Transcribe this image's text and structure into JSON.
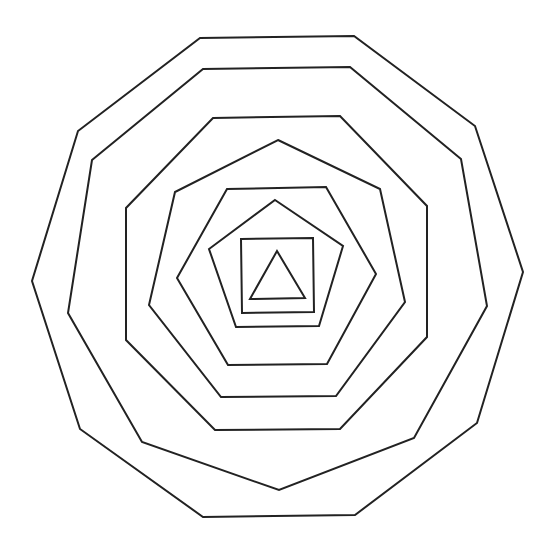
{
  "diagram": {
    "background": "#ffffff",
    "stroke_color": "#222222",
    "stroke_width": 2,
    "shapes": [
      {
        "name": "decagon",
        "sides": 10,
        "points": "200,38 354,36 475,126 523,272 477,423 355,515 203,517 80,429 32,281 78,131"
      },
      {
        "name": "nonagon",
        "sides": 9,
        "points": "203,69 350,67 461,159 487,306 414,438 279,490 142,442 68,313 92,160"
      },
      {
        "name": "octagon",
        "sides": 8,
        "points": "213,118 340,116 427,206 427,337 340,429 215,430 126,340 126,208"
      },
      {
        "name": "heptagon",
        "sides": 7,
        "points": "278,140 380,189 405,302 336,396 221,397 149,305 175,192"
      },
      {
        "name": "hexagon",
        "sides": 6,
        "points": "227,189 326,187 376,274 327,364 228,365 177,278"
      },
      {
        "name": "pentagon",
        "sides": 5,
        "points": "275,200 343,246 319,326 236,327 209,249"
      },
      {
        "name": "square",
        "sides": 4,
        "points": "241,239 313,238 314,312 242,313"
      },
      {
        "name": "triangle",
        "sides": 3,
        "points": "277,251 305,298 250,299"
      }
    ]
  }
}
